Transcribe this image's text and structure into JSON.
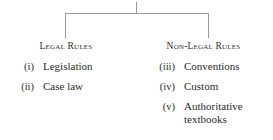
{
  "diagram": {
    "type": "bracket-tree",
    "root_connector": {
      "stem_label": "",
      "branch_count": 2
    },
    "colors": {
      "background": "#ffffff",
      "text": "#2b2b2b",
      "connector_line": "#9b9b9b"
    },
    "branches": [
      {
        "heading": "Legal Rules",
        "items": [
          {
            "numeral": "(i)",
            "label": "Legislation",
            "lines": [
              "Legislation"
            ]
          },
          {
            "numeral": "(ii)",
            "label": "Case law",
            "lines": [
              "Case law"
            ]
          }
        ]
      },
      {
        "heading": "Non-Legal Rules",
        "items": [
          {
            "numeral": "(iii)",
            "label": "Conventions",
            "lines": [
              "Conventions"
            ]
          },
          {
            "numeral": "(iv)",
            "label": "Custom",
            "lines": [
              "Custom"
            ]
          },
          {
            "numeral": "(v)",
            "label": "Authoritative textbooks",
            "lines": [
              "Authoritative",
              "textbooks"
            ]
          }
        ]
      }
    ]
  }
}
